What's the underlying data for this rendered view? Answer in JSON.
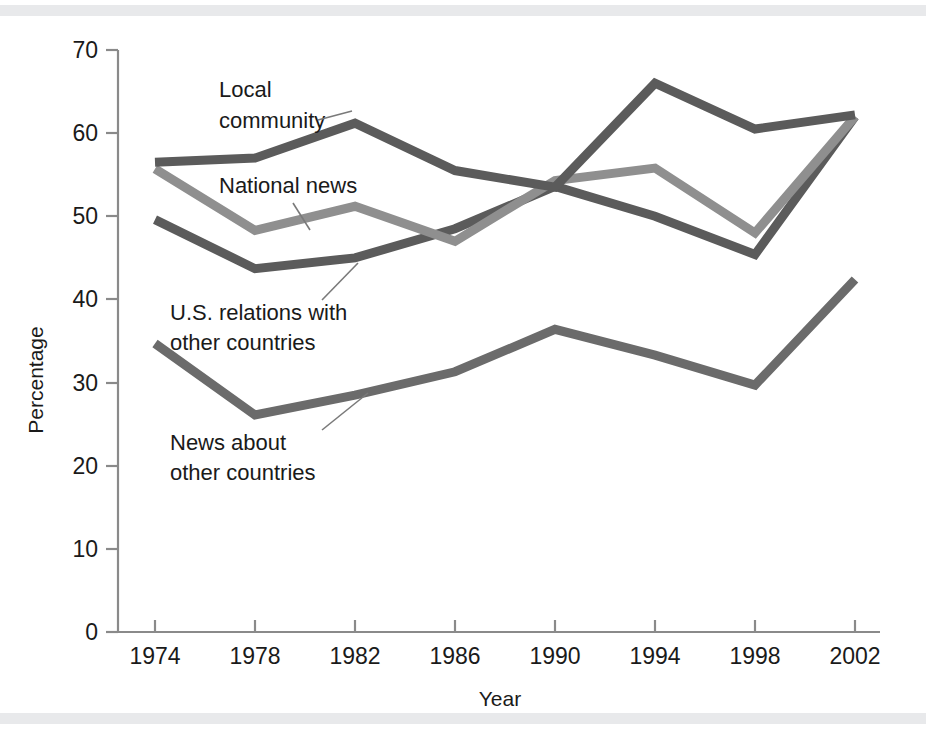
{
  "figure": {
    "background_color": "#ffffff",
    "band_color": "#e8e9eb"
  },
  "chart_data": {
    "type": "line",
    "title": "",
    "xlabel": "Year",
    "ylabel": "Percentage",
    "categories": [
      1974,
      1978,
      1982,
      1986,
      1990,
      1994,
      1998,
      2002
    ],
    "x": [
      "1974",
      "1978",
      "1982",
      "1986",
      "1990",
      "1994",
      "1998",
      "2002"
    ],
    "xlim": [
      1974,
      2002
    ],
    "ylim": [
      0,
      70
    ],
    "yticks": [
      "0",
      "10",
      "20",
      "30",
      "40",
      "50",
      "60",
      "70"
    ],
    "ytick_values": [
      0,
      10,
      20,
      30,
      40,
      50,
      60,
      70
    ],
    "grid": false,
    "legend": "inline-annotations",
    "series": [
      {
        "name": "Local community",
        "color": "#5b5b5b",
        "values": [
          56.5,
          57.0,
          61.2,
          55.5,
          53.5,
          66.0,
          60.5,
          62.2
        ]
      },
      {
        "name": "National news",
        "color": "#8f8f8f",
        "values": [
          55.7,
          48.3,
          51.2,
          47.0,
          54.3,
          55.8,
          48.0,
          62.0
        ]
      },
      {
        "name": "U.S. relations with other countries",
        "color": "#5b5b5b",
        "values": [
          49.6,
          43.7,
          45.0,
          48.5,
          53.6,
          50.0,
          45.4,
          62.0
        ]
      },
      {
        "name": "News about other countries",
        "color": "#6b6b6b",
        "values": [
          34.7,
          26.1,
          28.5,
          31.3,
          36.4,
          33.3,
          29.7,
          42.4
        ]
      }
    ],
    "annotations": [
      {
        "text_lines": [
          "Local",
          "community"
        ],
        "series": "Local community"
      },
      {
        "text_lines": [
          "National news"
        ],
        "series": "National news"
      },
      {
        "text_lines": [
          "U.S. relations with",
          "other countries"
        ],
        "series": "U.S. relations with other countries"
      },
      {
        "text_lines": [
          "News about",
          "other countries"
        ],
        "series": "News about other countries"
      }
    ]
  }
}
